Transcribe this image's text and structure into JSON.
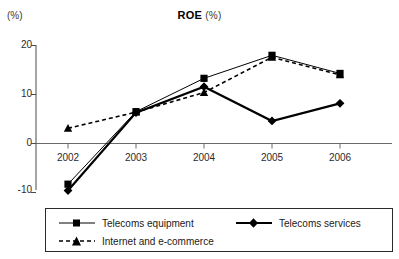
{
  "chart_data": {
    "type": "line",
    "title": "ROE",
    "title_unit": "(%)",
    "ylabel": "(%)",
    "xlabel": "",
    "categories": [
      "2002",
      "2003",
      "2004",
      "2005",
      "2006"
    ],
    "x": [
      2002,
      2003,
      2004,
      2005,
      2006
    ],
    "ylim": [
      -10,
      20
    ],
    "yticks": [
      20,
      10,
      0,
      -10
    ],
    "ytick_labels": [
      "20",
      "10",
      "0",
      "-10"
    ],
    "grid": false,
    "legend_position": "bottom",
    "zero_line": true,
    "series": [
      {
        "name": "Telecoms equipment",
        "marker": "square",
        "line_style": "solid",
        "line_weight": "thin",
        "color": "#000000",
        "values": [
          -8.3,
          6.5,
          13.3,
          18.0,
          14.3
        ]
      },
      {
        "name": "Telecoms services",
        "marker": "diamond",
        "line_style": "solid",
        "line_weight": "thick",
        "color": "#000000",
        "values": [
          -9.6,
          6.3,
          11.6,
          4.6,
          8.2
        ]
      },
      {
        "name": "Internet and e-commerce",
        "marker": "triangle",
        "line_style": "dashed",
        "line_weight": "medium",
        "color": "#000000",
        "values": [
          3.1,
          6.4,
          10.4,
          17.6,
          14.0
        ]
      }
    ]
  },
  "legend": {
    "items": [
      {
        "label": "Telecoms equipment"
      },
      {
        "label": "Telecoms services"
      },
      {
        "label": "Internet and e-commerce"
      }
    ]
  }
}
